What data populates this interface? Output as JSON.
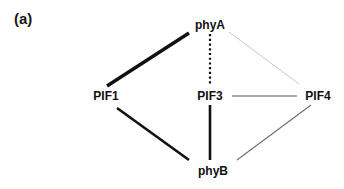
{
  "figure": {
    "panel_label": "(a)",
    "width": 344,
    "height": 189,
    "background_color": "#ffffff"
  },
  "chart_data": {
    "type": "network-diagram",
    "title": "",
    "nodes": [
      {
        "id": "phyA",
        "label": "phyA",
        "x": 210,
        "y": 25
      },
      {
        "id": "PIF1",
        "label": "PIF1",
        "x": 106,
        "y": 96
      },
      {
        "id": "PIF3",
        "label": "PIF3",
        "x": 210,
        "y": 96
      },
      {
        "id": "PIF4",
        "label": "PIF4",
        "x": 318,
        "y": 96
      },
      {
        "id": "phyB",
        "label": "phyB",
        "x": 213,
        "y": 171
      }
    ],
    "edges": [
      {
        "source": "phyA",
        "target": "PIF1",
        "style": "solid",
        "color": "#111111",
        "width": 3.4,
        "weight": "very-strong",
        "x1": 189,
        "y1": 33,
        "x2": 107,
        "y2": 86
      },
      {
        "source": "phyA",
        "target": "PIF3",
        "style": "dotted",
        "color": "#111111",
        "width": 2.2,
        "weight": "dotted-interaction",
        "x1": 210,
        "y1": 34,
        "x2": 210,
        "y2": 86
      },
      {
        "source": "phyA",
        "target": "PIF4",
        "style": "solid",
        "color": "#b9b9b9",
        "width": 0.8,
        "weight": "very-weak",
        "x1": 229,
        "y1": 32,
        "x2": 299,
        "y2": 84
      },
      {
        "source": "PIF3",
        "target": "PIF4",
        "style": "solid",
        "color": "#8a8a8a",
        "width": 1.5,
        "weight": "weak",
        "x1": 232,
        "y1": 96,
        "x2": 297,
        "y2": 96
      },
      {
        "source": "PIF3",
        "target": "phyB",
        "style": "solid",
        "color": "#111111",
        "width": 2.6,
        "weight": "strong",
        "x1": 210,
        "y1": 105,
        "x2": 210,
        "y2": 160
      },
      {
        "source": "PIF1",
        "target": "phyB",
        "style": "solid",
        "color": "#111111",
        "width": 2.6,
        "weight": "strong",
        "x1": 117,
        "y1": 108,
        "x2": 189,
        "y2": 160
      },
      {
        "source": "phyB",
        "target": "PIF4",
        "style": "solid",
        "color": "#6e6e6e",
        "width": 1.1,
        "weight": "weak",
        "x1": 237,
        "y1": 160,
        "x2": 311,
        "y2": 105
      }
    ],
    "legend": [],
    "grid": false
  }
}
